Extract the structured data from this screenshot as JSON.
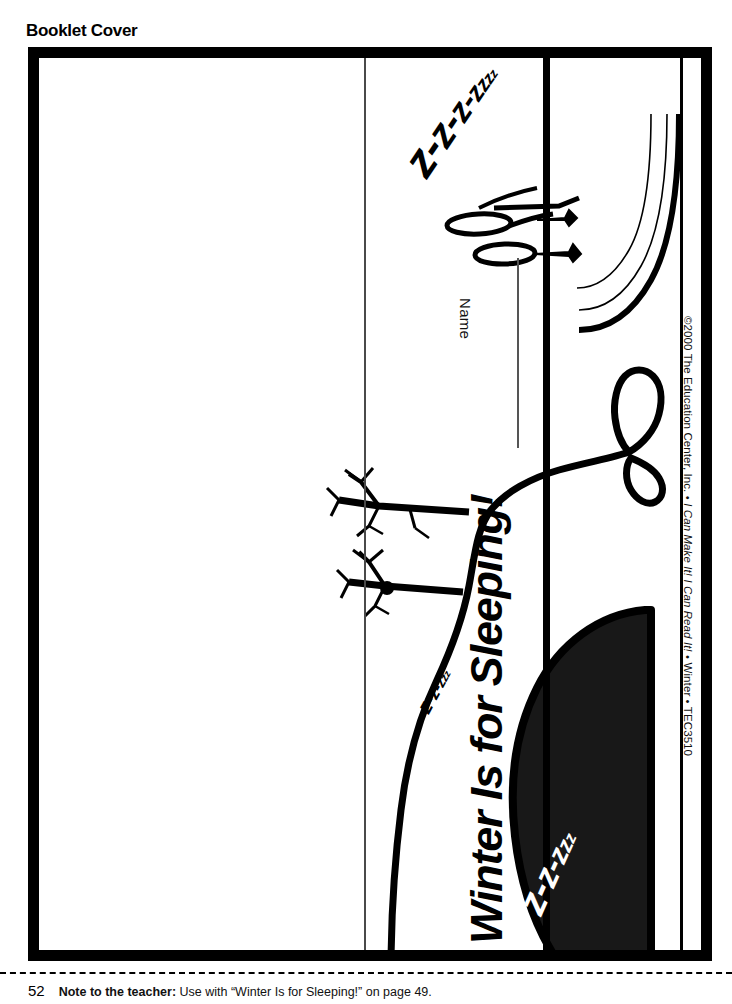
{
  "page": {
    "heading": "Booklet Cover"
  },
  "cover": {
    "title": "Winter Is for Sleeping!",
    "name_label": "Name",
    "snore_big": [
      "z",
      "z",
      "z",
      "z",
      "z",
      "z",
      "z"
    ],
    "snore_big_text": "z-z-z-z-z-z-z",
    "snore_small": [
      "z",
      "z",
      "z",
      "z",
      "z"
    ],
    "snore_small_text": "z-z-z-z-z",
    "snore_cave": [
      "z",
      "z",
      "z",
      "z",
      "z"
    ],
    "snore_cave_text": "z-z-z-z-z",
    "separator": "-",
    "copyright_symbol": "©2000 ",
    "copyright_publisher": "The Education Center, Inc. • ",
    "copyright_series": "I Can Make It! I Can Read It!",
    "copyright_tail": " • Winter • TEC3510",
    "copyright_full": "©2000 The Education Center, Inc. • I Can Make It! I Can Read It! • Winter • TEC3510"
  },
  "footer": {
    "page_number": "52",
    "note_label": "Note to the teacher:",
    "note_text": " Use with “Winter Is for Sleeping!” on page 49."
  },
  "colors": {
    "ink": "#000000",
    "paper": "#ffffff",
    "cave_fill": "#181818",
    "fold_gray": "#4a4a4a"
  }
}
